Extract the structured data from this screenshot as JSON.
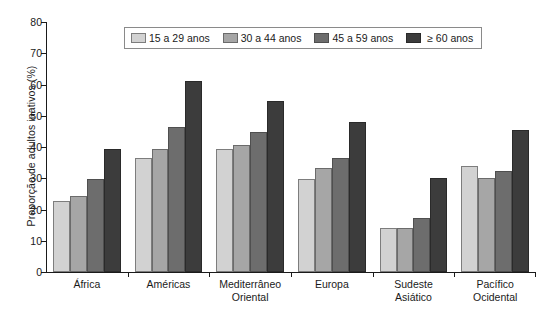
{
  "chart_data": {
    "type": "bar",
    "title": "",
    "subtitle": "",
    "xlabel": "",
    "ylabel": "Proporção de adultos inativos (%)",
    "ylim": [
      0,
      80
    ],
    "yticks": [
      0,
      10,
      20,
      30,
      40,
      50,
      60,
      70,
      80
    ],
    "ytick_labels": [
      "0",
      "10",
      "20",
      "30",
      "40",
      "50",
      "60",
      "70",
      "80"
    ],
    "grid": false,
    "legend_position": "top-center",
    "categories": [
      "África",
      "Américas",
      "Mediterrâneo Oriental",
      "Europa",
      "Sudeste Asiático",
      "Pacífico Ocidental"
    ],
    "category_lines": [
      [
        "África"
      ],
      [
        "Américas"
      ],
      [
        "Mediterrâneo",
        "Oriental"
      ],
      [
        "Europa"
      ],
      [
        "Sudeste",
        "Asiático"
      ],
      [
        "Pacífico",
        "Ocidental"
      ]
    ],
    "series": [
      {
        "name": "15 a 29 anos",
        "color": "#d2d2d2",
        "values": [
          22.7,
          36.5,
          39.3,
          29.8,
          14.2,
          34.0
        ]
      },
      {
        "name": "30 a 44 anos",
        "color": "#a6a6a6",
        "values": [
          24.3,
          39.5,
          40.6,
          33.3,
          14.0,
          30.1
        ]
      },
      {
        "name": "45 a 59 anos",
        "color": "#6d6d6d",
        "values": [
          29.8,
          46.4,
          44.7,
          36.4,
          17.2,
          32.4
        ]
      },
      {
        "name": "≥ 60 anos",
        "color": "#3c3c3c",
        "values": [
          39.5,
          61.2,
          54.7,
          48.1,
          30.0,
          45.3
        ]
      }
    ]
  },
  "legend": {
    "items": [
      {
        "label": "15 a 29 anos",
        "swatch": "legend-swatch-15-29"
      },
      {
        "label": "30 a 44 anos",
        "swatch": "legend-swatch-30-44"
      },
      {
        "label": "45 a 59 anos",
        "swatch": "legend-swatch-45-59"
      },
      {
        "label": "≥ 60 anos",
        "swatch": "legend-swatch-60-plus"
      }
    ]
  }
}
